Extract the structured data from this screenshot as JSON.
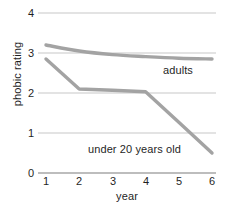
{
  "chart_data": {
    "type": "line",
    "title": "",
    "xlabel": "year",
    "ylabel": "phobic rating",
    "x": [
      1,
      2,
      3,
      4,
      5,
      6
    ],
    "xlim": [
      1,
      6
    ],
    "ylim": [
      0,
      4
    ],
    "yticks": [
      0,
      1,
      2,
      3,
      4
    ],
    "xticks": [
      1,
      2,
      3,
      4,
      5,
      6
    ],
    "grid": true,
    "legend_position": "inline-annotation",
    "series": [
      {
        "name": "adults",
        "values": [
          3.2,
          3.05,
          2.96,
          2.91,
          2.87,
          2.85
        ],
        "color": "#a3a3a3"
      },
      {
        "name": "under 20 years old",
        "values": [
          2.85,
          2.1,
          2.07,
          2.03,
          1.27,
          0.5
        ],
        "color": "#a3a3a3"
      }
    ],
    "annotations": [
      {
        "text": "adults",
        "x": 5.1,
        "y": 2.62
      },
      {
        "text": "under 20 years old",
        "x": 2.5,
        "y": 0.85
      }
    ]
  },
  "axes": {
    "y_tick_labels": [
      "4",
      "3",
      "2",
      "1",
      "0"
    ],
    "x_tick_labels": [
      "1",
      "2",
      "3",
      "4",
      "5",
      "6"
    ],
    "y_title": "phobic rating",
    "x_title": "year"
  },
  "style": {
    "line_color": "#a3a3a3",
    "grid_color": "#e3e3e3",
    "axis_color": "#bdbdbd",
    "background": "#ffffff",
    "text_color": "#1f1f1f"
  }
}
